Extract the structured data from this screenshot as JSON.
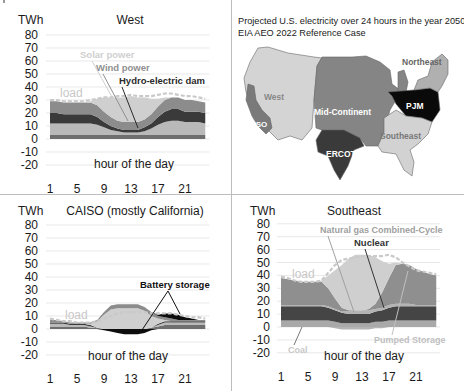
{
  "figure": {
    "colors": {
      "background": "#ffffff",
      "grid": "#d8d8d8",
      "axis_text": "#1a1a1a",
      "load": "#c9c9c9",
      "coal": "#a9a9a9",
      "ngcc": "#8f8f8f",
      "nuclear": "#454545",
      "hydro": "#3a3a3a",
      "wind": "#8c8c8c",
      "solar": "#cfcfcf",
      "battery": "#0d0d0d",
      "pumped": "#b4b4b4",
      "other_base": "#6e6e6e",
      "base_light": "#b9b9b9"
    }
  },
  "map_panel": {
    "title_line1": "Projected U.S. electricity over 24 hours in the year 2050",
    "title_line2": "EIA AEO 2022 Reference Case",
    "regions": [
      {
        "name": "West",
        "label": "West",
        "color": "#d4d4d4"
      },
      {
        "name": "CAISO",
        "label": "CAISO",
        "color": "#7a7a7a"
      },
      {
        "name": "Mid-Continent",
        "label": "Mid-Continent",
        "color": "#858585"
      },
      {
        "name": "ERCOT",
        "label": "ERCOT",
        "color": "#3a3a3a"
      },
      {
        "name": "PJM",
        "label": "PJM",
        "color": "#0a0a0a"
      },
      {
        "name": "Southeast",
        "label": "Southeast",
        "color": "#d2d2d2"
      },
      {
        "name": "Northeast",
        "label": "Northeast",
        "color": "#b0b0b0"
      }
    ]
  },
  "chart_data": [
    {
      "type": "area",
      "title": "West",
      "ylabel": "TWh",
      "xlabel": "hour of the day",
      "yticks": [
        80,
        70,
        60,
        50,
        40,
        30,
        20,
        10,
        0,
        -10,
        -20
      ],
      "xticks": [
        1,
        5,
        9,
        13,
        17,
        21
      ],
      "ylim": [
        -20,
        80
      ],
      "xlim": [
        1,
        24
      ],
      "grid": true,
      "stacked": true,
      "x": [
        1,
        2,
        3,
        4,
        5,
        6,
        7,
        8,
        9,
        10,
        11,
        12,
        13,
        14,
        15,
        16,
        17,
        18,
        19,
        20,
        21,
        22,
        23,
        24
      ],
      "series": [
        {
          "name": "Other base",
          "color_key": "other_base",
          "values": [
            3,
            3,
            3,
            3,
            3,
            3,
            3,
            3,
            3,
            3,
            3,
            3,
            3,
            3,
            3,
            3,
            3,
            3,
            3,
            3,
            3,
            3,
            3,
            3
          ]
        },
        {
          "name": "Gas / base",
          "color_key": "base_light",
          "values": [
            9,
            9,
            9,
            9,
            9,
            9,
            9,
            8,
            6,
            4,
            3,
            2,
            2,
            2,
            3,
            5,
            8,
            10,
            11,
            11,
            10,
            10,
            10,
            9
          ]
        },
        {
          "name": "Hydro-electric dam",
          "color_key": "hydro",
          "values": [
            8,
            8,
            7,
            7,
            7,
            7,
            7,
            6,
            4,
            3,
            2,
            2,
            2,
            2,
            3,
            4,
            6,
            8,
            9,
            9,
            8,
            8,
            8,
            8
          ]
        },
        {
          "name": "Wind power",
          "color_key": "wind",
          "values": [
            9,
            9,
            9,
            9,
            9,
            9,
            9,
            9,
            8,
            7,
            6,
            6,
            6,
            6,
            6,
            7,
            8,
            9,
            9,
            9,
            9,
            9,
            8,
            8
          ]
        },
        {
          "name": "Solar power",
          "color_key": "solar",
          "values": [
            0,
            0,
            0,
            0,
            0,
            0,
            1,
            5,
            11,
            15,
            18,
            19,
            20,
            19,
            17,
            12,
            6,
            2,
            0,
            0,
            0,
            0,
            0,
            0
          ]
        }
      ],
      "load": [
        30,
        30,
        29,
        29,
        29,
        29,
        30,
        31,
        32,
        32,
        33,
        33,
        34,
        33,
        33,
        33,
        34,
        35,
        35,
        34,
        33,
        33,
        32,
        31
      ],
      "annotations": [
        {
          "text": "Solar power",
          "color_key": "solar"
        },
        {
          "text": "Wind power",
          "color_key": "wind"
        },
        {
          "text": "Hydro-electric dam",
          "color_key": "hydro"
        },
        {
          "text": "load",
          "color_key": "load"
        }
      ]
    },
    {
      "type": "area",
      "title": "CAISO (mostly California)",
      "ylabel": "TWh",
      "xlabel": "hour of the day",
      "yticks": [
        80,
        70,
        60,
        50,
        40,
        30,
        20,
        10,
        0,
        -10,
        -20
      ],
      "xticks": [
        1,
        5,
        9,
        13,
        17,
        21
      ],
      "ylim": [
        -20,
        80
      ],
      "xlim": [
        1,
        24
      ],
      "grid": true,
      "stacked": true,
      "x": [
        1,
        2,
        3,
        4,
        5,
        6,
        7,
        8,
        9,
        10,
        11,
        12,
        13,
        14,
        15,
        16,
        17,
        18,
        19,
        20,
        21,
        22,
        23,
        24
      ],
      "series": [
        {
          "name": "Base",
          "color_key": "other_base",
          "values": [
            2,
            2,
            2,
            2,
            2,
            2,
            1,
            1,
            0,
            0,
            0,
            0,
            0,
            0,
            0,
            1,
            2,
            3,
            3,
            3,
            3,
            3,
            3,
            3
          ]
        },
        {
          "name": "Gas",
          "color_key": "base_light",
          "values": [
            2,
            2,
            2,
            1,
            1,
            1,
            1,
            0,
            0,
            0,
            0,
            0,
            0,
            0,
            0,
            0,
            1,
            2,
            2,
            2,
            2,
            2,
            2,
            2
          ]
        },
        {
          "name": "Hydro",
          "color_key": "hydro",
          "values": [
            1,
            1,
            1,
            1,
            1,
            1,
            1,
            0,
            0,
            0,
            0,
            0,
            0,
            0,
            0,
            0,
            1,
            1,
            1,
            1,
            1,
            1,
            1,
            1
          ]
        },
        {
          "name": "Solar power",
          "color_key": "solar",
          "values": [
            0,
            0,
            0,
            0,
            0,
            0,
            1,
            5,
            11,
            15,
            16,
            16,
            16,
            16,
            14,
            9,
            4,
            1,
            0,
            0,
            0,
            0,
            0,
            0
          ]
        },
        {
          "name": "Wind",
          "color_key": "wind",
          "values": [
            2,
            2,
            1,
            1,
            1,
            1,
            1,
            1,
            2,
            3,
            3,
            3,
            3,
            3,
            3,
            3,
            2,
            2,
            2,
            1,
            1,
            1,
            1,
            1
          ]
        },
        {
          "name": "Battery storage (discharge)",
          "color_key": "battery",
          "values": [
            0,
            0,
            0,
            0,
            0,
            0,
            0,
            0,
            0,
            0,
            0,
            0,
            0,
            0,
            0,
            0,
            1,
            3,
            4,
            4,
            2,
            1,
            0,
            0
          ]
        }
      ],
      "negative_series": [
        {
          "name": "Battery storage (charge)",
          "color_key": "battery",
          "values": [
            0,
            0,
            0,
            0,
            0,
            0,
            0,
            0,
            -1,
            -2,
            -3,
            -4,
            -4,
            -4,
            -3,
            -1,
            0,
            0,
            0,
            0,
            0,
            0,
            0,
            0
          ]
        }
      ],
      "load": [
        8,
        7,
        6,
        6,
        5,
        5,
        5,
        6,
        8,
        10,
        12,
        13,
        13,
        13,
        13,
        12,
        12,
        12,
        12,
        11,
        10,
        9,
        9,
        8
      ],
      "annotations": [
        {
          "text": "load",
          "color_key": "load"
        },
        {
          "text": "Battery storage",
          "color_key": "battery"
        }
      ]
    },
    {
      "type": "area",
      "title": "Southeast",
      "ylabel": "TWh",
      "xlabel": "hour of the day",
      "yticks": [
        80,
        70,
        60,
        50,
        40,
        30,
        20,
        10,
        0,
        -10,
        -20
      ],
      "xticks": [
        1,
        5,
        9,
        13,
        17,
        21
      ],
      "ylim": [
        -20,
        80
      ],
      "xlim": [
        1,
        24
      ],
      "grid": true,
      "stacked": true,
      "x": [
        1,
        2,
        3,
        4,
        5,
        6,
        7,
        8,
        9,
        10,
        11,
        12,
        13,
        14,
        15,
        16,
        17,
        18,
        19,
        20,
        21,
        22,
        23,
        24
      ],
      "series": [
        {
          "name": "Coal",
          "color_key": "coal",
          "values": [
            5,
            5,
            5,
            5,
            5,
            5,
            5,
            5,
            4,
            3,
            3,
            3,
            3,
            3,
            4,
            4,
            5,
            5,
            5,
            5,
            5,
            5,
            5,
            5
          ]
        },
        {
          "name": "Nuclear",
          "color_key": "nuclear",
          "values": [
            11,
            11,
            11,
            11,
            11,
            11,
            11,
            10,
            9,
            8,
            7,
            7,
            7,
            7,
            8,
            9,
            10,
            11,
            11,
            11,
            11,
            11,
            11,
            11
          ]
        },
        {
          "name": "Pumped Storage",
          "color_key": "pumped",
          "values": [
            1,
            1,
            1,
            1,
            1,
            1,
            1,
            1,
            1,
            1,
            2,
            3,
            3,
            3,
            2,
            2,
            2,
            2,
            2,
            2,
            1,
            1,
            1,
            1
          ]
        },
        {
          "name": "Natural gas Combined-Cycle",
          "color_key": "ngcc",
          "values": [
            21,
            20,
            19,
            18,
            18,
            18,
            18,
            14,
            8,
            3,
            1,
            0,
            0,
            1,
            4,
            12,
            21,
            30,
            31,
            30,
            28,
            26,
            24,
            23
          ]
        },
        {
          "name": "Solar",
          "color_key": "solar",
          "values": [
            0,
            0,
            0,
            0,
            0,
            0,
            1,
            10,
            22,
            33,
            40,
            43,
            43,
            42,
            36,
            24,
            11,
            2,
            0,
            0,
            0,
            0,
            0,
            0
          ]
        }
      ],
      "negative_series": [
        {
          "name": "Pumped Storage (charge)",
          "color_key": "pumped",
          "values": [
            0,
            0,
            0,
            0,
            0,
            0,
            0,
            0,
            -1,
            -2,
            -2,
            -2,
            -2,
            -2,
            -1,
            -1,
            0,
            0,
            0,
            0,
            0,
            0,
            0,
            0
          ]
        }
      ],
      "load": [
        39,
        38,
        36,
        35,
        35,
        35,
        36,
        42,
        48,
        52,
        53,
        54,
        55,
        55,
        55,
        55,
        56,
        54,
        50,
        47,
        44,
        43,
        42,
        41
      ],
      "annotations": [
        {
          "text": "Natural gas Combined-Cycle",
          "color_key": "ngcc"
        },
        {
          "text": "Nuclear",
          "color_key": "nuclear"
        },
        {
          "text": "load",
          "color_key": "load"
        },
        {
          "text": "Pumped Storage",
          "color_key": "pumped"
        },
        {
          "text": "Coal",
          "color_key": "coal"
        }
      ]
    }
  ]
}
